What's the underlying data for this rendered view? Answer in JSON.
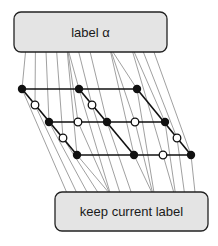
{
  "diagram": {
    "top_box": {
      "label": "label α",
      "x": 14,
      "y": 12,
      "w": 153,
      "h": 40
    },
    "bottom_box": {
      "label": "keep current label",
      "x": 55,
      "y": 192,
      "w": 153,
      "h": 39
    },
    "colors": {
      "box_fill": "#e4e4e4",
      "box_stroke": "#222222",
      "edge": "#888888",
      "lattice": "#111111",
      "filled_node": "#111111",
      "open_node": "#ffffff"
    },
    "filled_nodes": [
      [
        22,
        89
      ],
      [
        79,
        89
      ],
      [
        137,
        89
      ],
      [
        49,
        122
      ],
      [
        107,
        122
      ],
      [
        165,
        122
      ],
      [
        77,
        155
      ],
      [
        134,
        155
      ],
      [
        191,
        155
      ]
    ],
    "open_nodes": [
      [
        35,
        105
      ],
      [
        92,
        105
      ],
      [
        78,
        122
      ],
      [
        135,
        122
      ],
      [
        63,
        138
      ],
      [
        177,
        138
      ],
      [
        163,
        155
      ]
    ]
  }
}
